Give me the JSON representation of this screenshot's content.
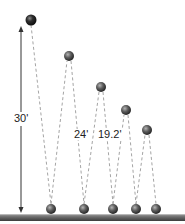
{
  "diagram": {
    "initial_height_label": "30'",
    "bounce_labels": [
      "24'",
      "19.2'"
    ],
    "colors": {
      "ball_dark": "#1a1a1a",
      "ball_mid": "#555555",
      "ball_light": "#8a8a8a",
      "dash": "#9a9a9a",
      "arrow": "#333333",
      "ground_top": "#8c8c8c",
      "ground_bottom": "#4a4a4a"
    },
    "start_ball": {
      "x": 31,
      "y": 20,
      "r": 5.5
    },
    "peak_balls": [
      {
        "x": 69,
        "y": 56,
        "r": 5
      },
      {
        "x": 101,
        "y": 87,
        "r": 5
      },
      {
        "x": 126,
        "y": 110,
        "r": 5
      },
      {
        "x": 147,
        "y": 130,
        "r": 5
      }
    ],
    "ground_balls": [
      {
        "x": 51,
        "y": 209,
        "r": 5
      },
      {
        "x": 84,
        "y": 209,
        "r": 5
      },
      {
        "x": 113,
        "y": 209,
        "r": 5
      },
      {
        "x": 136,
        "y": 209,
        "r": 5
      },
      {
        "x": 156,
        "y": 209,
        "r": 5
      }
    ],
    "arrow": {
      "x": 21,
      "y_top": 27,
      "y_bottom": 213
    },
    "ground": {
      "y": 214,
      "height": 7
    }
  }
}
